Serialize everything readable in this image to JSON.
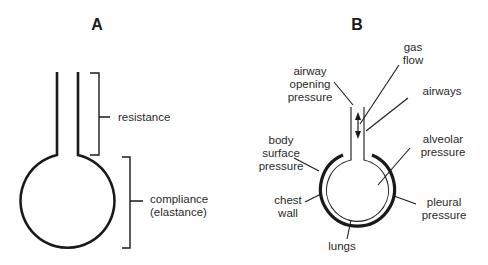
{
  "panel_a": {
    "title": "A",
    "labels": {
      "resistance": "resistance",
      "compliance_line1": "compliance",
      "compliance_line2": "(elastance)"
    }
  },
  "panel_b": {
    "title": "B",
    "labels": {
      "gas_flow_line1": "gas",
      "gas_flow_line2": "flow",
      "airway_opening_line1": "airway",
      "airway_opening_line2": "opening",
      "airway_opening_line3": "pressure",
      "airways": "airways",
      "body_surface_line1": "body",
      "body_surface_line2": "surface",
      "body_surface_line3": "pressure",
      "alveolar_line1": "alveolar",
      "alveolar_line2": "pressure",
      "chest_wall_line1": "chest",
      "chest_wall_line2": "wall",
      "pleural_line1": "pleural",
      "pleural_line2": "pressure",
      "lungs": "lungs"
    }
  },
  "colors": {
    "stroke": "#1a1a1a",
    "text": "#2a2a2a",
    "background": "#ffffff"
  }
}
